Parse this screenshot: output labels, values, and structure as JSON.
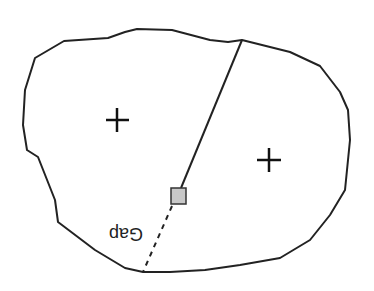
{
  "diagram": {
    "regions": [
      {
        "name": "left-region",
        "marker": "+"
      },
      {
        "name": "right-region",
        "marker": "+"
      }
    ],
    "gap_label": "Gap",
    "colors": {
      "stroke": "#222222",
      "node_fill": "#c8c8c8",
      "background": "#ffffff"
    }
  }
}
